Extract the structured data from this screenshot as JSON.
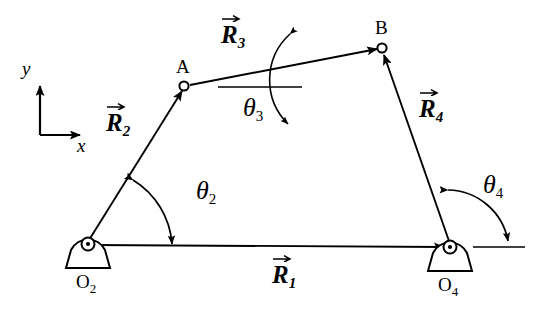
{
  "figure": {
    "stroke_color": "#000000",
    "background_color": "#ffffff",
    "axes": {
      "y_label": "y",
      "x_label": "x"
    },
    "joints": [
      {
        "name": "A",
        "label": "A",
        "type": "pin-joint",
        "x": 184,
        "y": 86
      },
      {
        "name": "B",
        "label": "B",
        "type": "pin-joint",
        "x": 382,
        "y": 48
      },
      {
        "name": "O2",
        "label": "O",
        "sub": "2",
        "type": "ground-pivot",
        "x": 88,
        "y": 244
      },
      {
        "name": "O4",
        "label": "O",
        "sub": "4",
        "type": "ground-pivot",
        "x": 450,
        "y": 247
      }
    ],
    "vectors": [
      {
        "name": "R1",
        "label": "R",
        "sub": "1",
        "from": "O2",
        "to": "O4",
        "label_x": 272,
        "label_y": 262
      },
      {
        "name": "R2",
        "label": "R",
        "sub": "2",
        "from": "O2",
        "to": "A",
        "label_x": 106,
        "label_y": 110
      },
      {
        "name": "R3",
        "label": "R",
        "sub": "3",
        "from": "A",
        "to": "B",
        "label_x": 221,
        "label_y": 22
      },
      {
        "name": "R4",
        "label": "R",
        "sub": "4",
        "from": "O4",
        "to": "B",
        "label_x": 419,
        "label_y": 96
      }
    ],
    "angles": [
      {
        "name": "theta2",
        "label": "θ",
        "sub": "2",
        "at": "O2",
        "label_x": 196,
        "label_y": 178
      },
      {
        "name": "theta3",
        "label": "θ",
        "sub": "3",
        "at": "A",
        "label_x": 243,
        "label_y": 95
      },
      {
        "name": "theta4",
        "label": "θ",
        "sub": "4",
        "at": "O4",
        "label_x": 483,
        "label_y": 172
      }
    ]
  }
}
